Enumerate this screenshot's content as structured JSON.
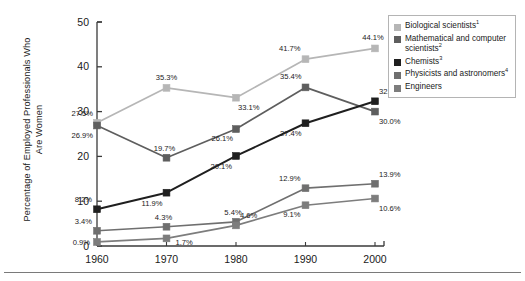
{
  "chart_data": {
    "type": "line",
    "title": "",
    "xlabel": "",
    "ylabel": "Percentage of Employed Professionals Who Are Women",
    "categories": [
      "1960",
      "1970",
      "1980",
      "1990",
      "2000"
    ],
    "x": [
      1960,
      1970,
      1980,
      1990,
      2000
    ],
    "ylim": [
      0,
      50
    ],
    "yticks": [
      "0",
      "10",
      "20",
      "30",
      "40",
      "50"
    ],
    "ytick_values": [
      0,
      10,
      20,
      30,
      40,
      50
    ],
    "grid": false,
    "legend_position": "right",
    "series": [
      {
        "name": "Biological scientists",
        "footnote": "1",
        "color": "#b6b6b6",
        "values": [
          27.5,
          35.3,
          33.1,
          41.7,
          44.1
        ],
        "labels": [
          "27.5%",
          "35.3%",
          "33.1%",
          "41.7%",
          "44.1%"
        ]
      },
      {
        "name": "Mathematical and computer scientists",
        "footnote": "2",
        "color": "#5e5e5e",
        "values": [
          26.9,
          19.7,
          26.1,
          35.4,
          30.0
        ],
        "labels": [
          "26.9%",
          "19.7%",
          "26.1%",
          "35.4%",
          "30.0%"
        ]
      },
      {
        "name": "Chemists",
        "footnote": "3",
        "color": "#1f1f1f",
        "values": [
          8.2,
          11.9,
          20.1,
          27.4,
          32.3
        ],
        "labels": [
          "8.2%",
          "11.9%",
          "20.1%",
          "27.4%",
          "32.3%"
        ]
      },
      {
        "name": "Physicists and astronomers",
        "footnote": "4",
        "color": "#6f6f6f",
        "values": [
          3.4,
          4.3,
          5.4,
          12.9,
          13.9
        ],
        "labels": [
          "3.4%",
          "4.3%",
          "5.4%",
          "12.9%",
          "13.9%"
        ]
      },
      {
        "name": "Engineers",
        "footnote": "",
        "color": "#7d7d7d",
        "values": [
          0.9,
          1.7,
          4.6,
          9.1,
          10.6
        ],
        "labels": [
          "0.9%",
          "1.7%",
          "4.6%",
          "9.1%",
          "10.6%"
        ]
      }
    ]
  },
  "legend": {
    "items": [
      {
        "label": "Biological scientists",
        "sup": "1",
        "color": "#b6b6b6"
      },
      {
        "label": "Mathematical and computer scientists",
        "sup": "2",
        "color": "#5e5e5e"
      },
      {
        "label": "Chemists",
        "sup": "3",
        "color": "#1f1f1f"
      },
      {
        "label": "Physicists and astronomers",
        "sup": "4",
        "color": "#6f6f6f"
      },
      {
        "label": "Engineers",
        "sup": "",
        "color": "#7d7d7d"
      }
    ]
  },
  "axis": {
    "y_title": "Percentage of Employed Professionals Who Are Women"
  }
}
